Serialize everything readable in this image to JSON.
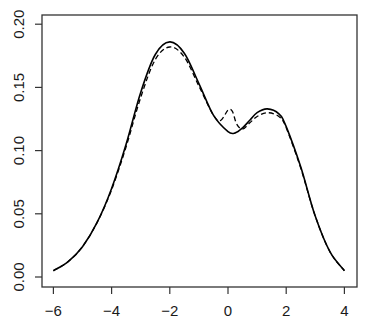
{
  "chart_data": {
    "type": "line",
    "title": "",
    "xlabel": "",
    "ylabel": "",
    "xlim": [
      -6.4,
      4.4
    ],
    "ylim": [
      -0.008,
      0.208
    ],
    "grid": false,
    "legend": null,
    "x_ticks": [
      -6,
      -4,
      -2,
      0,
      2,
      4
    ],
    "x_tick_labels": [
      "−6",
      "−4",
      "−2",
      "0",
      "2",
      "4"
    ],
    "y_ticks": [
      0.0,
      0.05,
      0.1,
      0.15,
      0.2
    ],
    "y_tick_labels": [
      "0.00",
      "0.05",
      "0.10",
      "0.15",
      "0.20"
    ],
    "series": [
      {
        "name": "solid",
        "style": "solid",
        "color": "#000000",
        "x": [
          -6.0,
          -5.5,
          -5.0,
          -4.5,
          -4.0,
          -3.5,
          -3.0,
          -2.5,
          -2.0,
          -1.5,
          -1.0,
          -0.5,
          0.0,
          0.25,
          0.5,
          0.75,
          1.0,
          1.35,
          1.75,
          2.0,
          2.5,
          3.0,
          3.5,
          4.0
        ],
        "values": [
          0.005,
          0.012,
          0.024,
          0.043,
          0.07,
          0.105,
          0.146,
          0.176,
          0.186,
          0.177,
          0.153,
          0.128,
          0.115,
          0.114,
          0.118,
          0.124,
          0.13,
          0.133,
          0.129,
          0.119,
          0.087,
          0.048,
          0.02,
          0.005
        ]
      },
      {
        "name": "dashed",
        "style": "dashed",
        "color": "#000000",
        "x": [
          -6.0,
          -5.5,
          -5.0,
          -4.5,
          -4.0,
          -3.5,
          -3.0,
          -2.5,
          -2.0,
          -1.5,
          -1.0,
          -0.5,
          -0.25,
          0.0,
          0.15,
          0.3,
          0.5,
          0.75,
          1.0,
          1.35,
          1.75,
          2.0,
          2.5,
          3.0,
          3.5,
          4.0
        ],
        "values": [
          0.005,
          0.012,
          0.024,
          0.043,
          0.069,
          0.103,
          0.142,
          0.172,
          0.182,
          0.174,
          0.151,
          0.128,
          0.124,
          0.132,
          0.131,
          0.121,
          0.117,
          0.122,
          0.127,
          0.13,
          0.127,
          0.118,
          0.086,
          0.048,
          0.02,
          0.005
        ]
      }
    ]
  }
}
